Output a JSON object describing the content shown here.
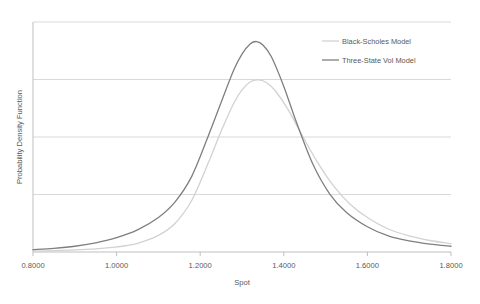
{
  "chart_data": {
    "type": "line",
    "title": "",
    "xlabel": "Spot",
    "ylabel": "Probability Density Function",
    "xlim": [
      0.8,
      1.8
    ],
    "ylim": [
      0,
      1
    ],
    "xticks": [
      0.8,
      1.0,
      1.2,
      1.4,
      1.6,
      1.8
    ],
    "xtick_labels": [
      "0.8000",
      "1.0000",
      "1.2000",
      "1.4000",
      "1.6000",
      "1.8000"
    ],
    "yticks": [],
    "ytick_labels": [],
    "grid": "horizontal",
    "gridline_values": [
      0.25,
      0.5,
      0.75
    ],
    "legend_position": "top-right-inside",
    "series": [
      {
        "name": "Black-Scholes Model",
        "color": "#D2D2D2",
        "x": [
          0.8,
          0.85,
          0.9,
          0.95,
          1.0,
          1.05,
          1.1,
          1.14,
          1.18,
          1.22,
          1.25,
          1.28,
          1.3,
          1.32,
          1.34,
          1.36,
          1.38,
          1.41,
          1.44,
          1.48,
          1.52,
          1.56,
          1.6,
          1.65,
          1.7,
          1.75,
          1.8
        ],
        "y": [
          0.004,
          0.006,
          0.009,
          0.014,
          0.022,
          0.038,
          0.072,
          0.125,
          0.225,
          0.39,
          0.525,
          0.646,
          0.705,
          0.74,
          0.748,
          0.735,
          0.7,
          0.62,
          0.52,
          0.392,
          0.285,
          0.205,
          0.15,
          0.1,
          0.07,
          0.05,
          0.036
        ]
      },
      {
        "name": "Three-State Vol Model",
        "color": "#7F7F7F",
        "x": [
          0.8,
          0.85,
          0.9,
          0.95,
          1.0,
          1.05,
          1.1,
          1.14,
          1.18,
          1.22,
          1.25,
          1.28,
          1.3,
          1.32,
          1.335,
          1.35,
          1.37,
          1.4,
          1.43,
          1.47,
          1.51,
          1.55,
          1.6,
          1.65,
          1.7,
          1.75,
          1.8
        ],
        "y": [
          0.01,
          0.016,
          0.025,
          0.04,
          0.062,
          0.096,
          0.15,
          0.218,
          0.33,
          0.508,
          0.65,
          0.79,
          0.86,
          0.905,
          0.915,
          0.9,
          0.85,
          0.72,
          0.565,
          0.38,
          0.252,
          0.172,
          0.11,
          0.07,
          0.048,
          0.034,
          0.025
        ]
      }
    ]
  },
  "axis": {
    "ylabel": "Probability Density Function",
    "xlabel": "Spot",
    "xtick_labels": [
      "0.8000",
      "1.0000",
      "1.2000",
      "1.4000",
      "1.6000",
      "1.8000"
    ]
  },
  "legend": {
    "items": [
      {
        "label": "Black-Scholes Model",
        "color": "#D2D2D2"
      },
      {
        "label": "Three-State Vol Model",
        "color": "#7F7F7F"
      }
    ]
  },
  "colors": {
    "black_scholes": "#D2D2D2",
    "three_state_vol": "#7F7F7F",
    "gridline": "#D9D9D9",
    "frame": "#BFBFBF",
    "text": "#595959",
    "background": "#FFFFFF"
  }
}
